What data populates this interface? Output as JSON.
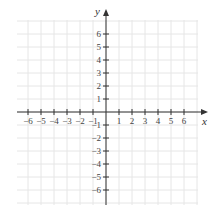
{
  "chart_data": {
    "type": "coordinate-plane",
    "title": "",
    "xlabel": "x",
    "ylabel": "y",
    "xlim": [
      -6,
      6
    ],
    "ylim": [
      -6,
      6
    ],
    "grid": true,
    "x_ticks": [
      -6,
      -5,
      -4,
      -3,
      -2,
      -1,
      1,
      2,
      3,
      4,
      5,
      6
    ],
    "y_ticks": [
      6,
      5,
      4,
      3,
      2,
      1,
      -1,
      -2,
      -3,
      -4,
      -5,
      -6
    ],
    "x_tick_labels": [
      "−6",
      "−5",
      "−4",
      "−3",
      "−2",
      "−1",
      "1",
      "2",
      "3",
      "4",
      "5",
      "6"
    ],
    "y_tick_labels": [
      "6",
      "5",
      "4",
      "3",
      "2",
      "1",
      "−1",
      "−2",
      "−3",
      "−4",
      "−5",
      "−6"
    ],
    "points": [],
    "series": []
  },
  "colors": {
    "axis": "#333333",
    "grid": "#e6e6e6",
    "label": "#444444"
  }
}
